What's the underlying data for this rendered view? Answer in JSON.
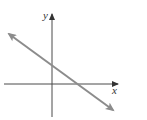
{
  "figure": {
    "x_axis_label": "x",
    "y_axis_label": "y",
    "colors": {
      "axes": "#4a4a4a",
      "line": "#8c8c8c",
      "background": "#ffffff"
    },
    "line": {
      "slope_sign": "negative",
      "y_intercept": "positive",
      "x_intercept": "positive",
      "arrows": "both ends"
    }
  }
}
